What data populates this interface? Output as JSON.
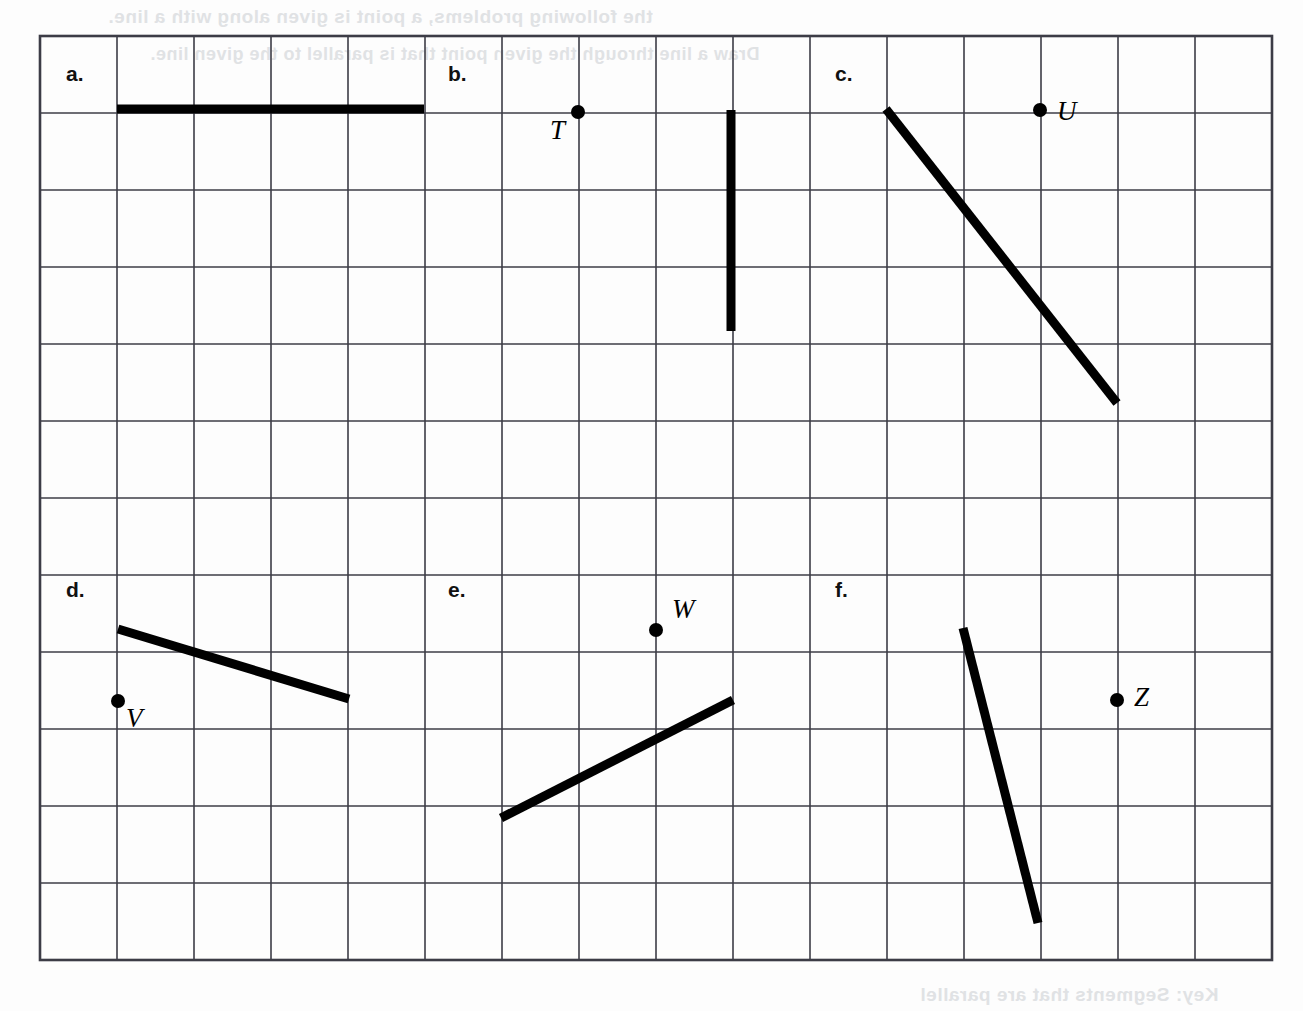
{
  "page": {
    "width": 1303,
    "height": 1011,
    "background_color": "#fdfdfd",
    "ink_color": "#000000",
    "grid_line_color": "#3c3c46",
    "bleed_text_color": "#c9ccd1"
  },
  "bleed_through": {
    "top_line_1": "the following problems, a point is given along with a line.",
    "top_line_2": "Draw a line through the given point that is parallel to the given line.",
    "bottom_line": "Key: Segments that are parallel"
  },
  "grid": {
    "origin_x": 40,
    "origin_y": 36,
    "cell_size": 77,
    "cols": 16,
    "rows": 12,
    "right": 1272,
    "bottom": 960,
    "inner_stroke": 1.6,
    "outer_stroke": 2.6
  },
  "problems": [
    {
      "id": "a",
      "label": "a.",
      "label_x": 66,
      "label_y": 62,
      "segment": {
        "x1": 117,
        "y1": 109,
        "x2": 424,
        "y2": 109,
        "width": 9
      },
      "point": null,
      "point_label": null
    },
    {
      "id": "b",
      "label": "b.",
      "label_x": 448,
      "label_y": 62,
      "segment": {
        "x1": 731,
        "y1": 110,
        "x2": 731,
        "y2": 331,
        "width": 9
      },
      "point": {
        "cx": 578,
        "cy": 112,
        "r": 7
      },
      "point_label": {
        "text": "T",
        "x": 550,
        "y": 115
      }
    },
    {
      "id": "c",
      "label": "c.",
      "label_x": 835,
      "label_y": 62,
      "segment": {
        "x1": 886,
        "y1": 109,
        "x2": 1117,
        "y2": 403,
        "width": 9
      },
      "point": {
        "cx": 1040,
        "cy": 110,
        "r": 7
      },
      "point_label": {
        "text": "U",
        "x": 1057,
        "y": 96
      }
    },
    {
      "id": "d",
      "label": "d.",
      "label_x": 66,
      "label_y": 578,
      "segment": {
        "x1": 118,
        "y1": 629,
        "x2": 349,
        "y2": 699,
        "width": 9
      },
      "point": {
        "cx": 118,
        "cy": 701,
        "r": 7
      },
      "point_label": {
        "text": "V",
        "x": 126,
        "y": 703
      }
    },
    {
      "id": "e",
      "label": "e.",
      "label_x": 448,
      "label_y": 578,
      "segment": {
        "x1": 501,
        "y1": 818,
        "x2": 733,
        "y2": 700,
        "width": 9
      },
      "point": {
        "cx": 656,
        "cy": 630,
        "r": 7
      },
      "point_label": {
        "text": "W",
        "x": 672,
        "y": 594
      }
    },
    {
      "id": "f",
      "label": "f.",
      "label_x": 835,
      "label_y": 578,
      "segment": {
        "x1": 963,
        "y1": 628,
        "x2": 1038,
        "y2": 923,
        "width": 9
      },
      "point": {
        "cx": 1117,
        "cy": 700,
        "r": 7
      },
      "point_label": {
        "text": "Z",
        "x": 1134,
        "y": 682
      }
    }
  ]
}
